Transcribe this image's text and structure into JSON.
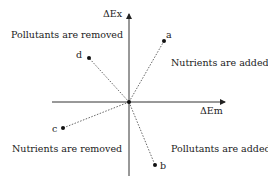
{
  "axes": {
    "y_label": "ΔEx",
    "x_label": "ΔEm"
  },
  "quadrants": {
    "top_left": "Pollutants are removed",
    "top_right": "Nutrients are added",
    "bottom_left": "Nutrients are removed",
    "bottom_right": "Pollutants are added"
  },
  "points": [
    {
      "label": "a",
      "x": 164,
      "y": 41
    },
    {
      "label": "b",
      "x": 155,
      "y": 165
    },
    {
      "label": "c",
      "x": 63,
      "y": 128
    },
    {
      "label": "d",
      "x": 89,
      "y": 58
    }
  ]
}
